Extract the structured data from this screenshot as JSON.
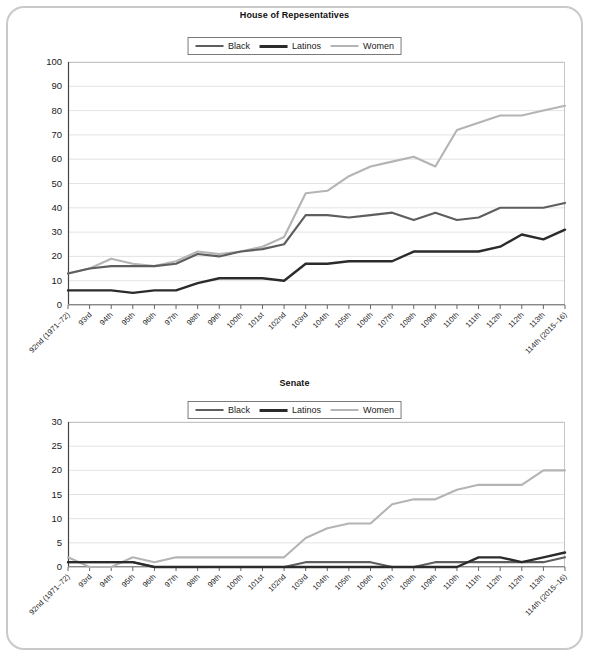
{
  "figure": {
    "border_color": "#c9c9c9",
    "background": "#ffffff"
  },
  "series_colors": {
    "Black": "#5e5e5e",
    "Latinos": "#2b2b2b",
    "Women": "#b4b4b4"
  },
  "legend": {
    "black_label": "Black",
    "latinos_label": "Latinos",
    "women_label": "Women"
  },
  "categories": [
    "92nd (1971–72)",
    "93rd",
    "94th",
    "95th",
    "96th",
    "97th",
    "98th",
    "99th",
    "100th",
    "101st",
    "102nd",
    "103rd",
    "104th",
    "105th",
    "106th",
    "107th",
    "108th",
    "109th",
    "110th",
    "111th",
    "112th",
    "112th",
    "113th",
    "114th (2015–16)"
  ],
  "chart_data": [
    {
      "type": "line",
      "title": "House of Repesentatives",
      "xlabel": "",
      "ylabel": "",
      "ylim": [
        0,
        100
      ],
      "yticks": [
        0,
        10,
        20,
        30,
        40,
        50,
        60,
        70,
        80,
        90,
        100
      ],
      "grid": true,
      "legend_position": "top-center",
      "categories": [
        "92nd (1971–72)",
        "93rd",
        "94th",
        "95th",
        "96th",
        "97th",
        "98th",
        "99th",
        "100th",
        "101st",
        "102nd",
        "103rd",
        "104th",
        "105th",
        "106th",
        "107th",
        "108th",
        "109th",
        "110th",
        "111th",
        "112th",
        "112th",
        "113th",
        "114th (2015–16)"
      ],
      "series": [
        {
          "name": "Black",
          "values": [
            13,
            15,
            16,
            16,
            16,
            17,
            21,
            20,
            22,
            23,
            25,
            37,
            37,
            36,
            37,
            38,
            35,
            38,
            35,
            36,
            40,
            40,
            40,
            42
          ]
        },
        {
          "name": "Latinos",
          "values": [
            6,
            6,
            6,
            5,
            6,
            6,
            9,
            11,
            11,
            11,
            10,
            17,
            17,
            18,
            18,
            18,
            22,
            22,
            22,
            22,
            24,
            29,
            27,
            31
          ]
        },
        {
          "name": "Women",
          "values": [
            13,
            15,
            19,
            17,
            16,
            18,
            22,
            21,
            22,
            24,
            28,
            46,
            47,
            53,
            57,
            59,
            61,
            57,
            72,
            75,
            78,
            78,
            80,
            82
          ]
        }
      ]
    },
    {
      "type": "line",
      "title": "Senate",
      "xlabel": "",
      "ylabel": "",
      "ylim": [
        0,
        30
      ],
      "yticks": [
        0,
        5,
        10,
        15,
        20,
        25,
        30
      ],
      "grid": true,
      "legend_position": "top-center",
      "categories": [
        "92nd (1971–72)",
        "93rd",
        "94th",
        "95th",
        "96th",
        "97th",
        "98th",
        "99th",
        "100th",
        "101st",
        "102nd",
        "103rd",
        "104th",
        "105th",
        "106th",
        "107th",
        "108th",
        "109th",
        "110th",
        "111th",
        "112th",
        "112th",
        "113th",
        "114th (2015–16)"
      ],
      "series": [
        {
          "name": "Black",
          "values": [
            1,
            1,
            1,
            1,
            0,
            0,
            0,
            0,
            0,
            0,
            0,
            1,
            1,
            1,
            1,
            0,
            0,
            1,
            1,
            1,
            1,
            1,
            1,
            2
          ]
        },
        {
          "name": "Latinos",
          "values": [
            1,
            1,
            1,
            1,
            0,
            0,
            0,
            0,
            0,
            0,
            0,
            0,
            0,
            0,
            0,
            0,
            0,
            0,
            0,
            2,
            2,
            1,
            2,
            3
          ]
        },
        {
          "name": "Women",
          "values": [
            2,
            0,
            0,
            2,
            1,
            2,
            2,
            2,
            2,
            2,
            2,
            6,
            8,
            9,
            9,
            13,
            14,
            14,
            16,
            17,
            17,
            17,
            20,
            20
          ]
        }
      ]
    }
  ]
}
